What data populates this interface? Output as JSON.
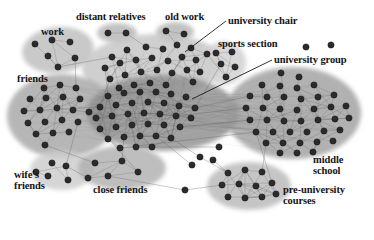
{
  "figure": {
    "background": "#ffffff",
    "width": 374,
    "height": 225
  },
  "style": {
    "node_fill": "#2b2b2b",
    "node_stroke": "#151515",
    "edge_color": "#5a5a5a",
    "label_color": "#141414",
    "leader_color": "#1b1b1b",
    "cluster_light": "#d2d2d2",
    "cluster_mid": "#b9b9b9",
    "cluster_dark": "#9a9a9a",
    "cluster_darkest": "#8a8a8a"
  },
  "labels": [
    {
      "id": "work",
      "text": "work",
      "x": 41,
      "y": 27,
      "size": 10.5
    },
    {
      "id": "distant-relatives",
      "text": "distant relatives",
      "x": 76,
      "y": 12,
      "size": 10.5
    },
    {
      "id": "old-work",
      "text": "old work",
      "x": 165,
      "y": 12,
      "size": 10.5
    },
    {
      "id": "university-chair",
      "text": "university chair",
      "x": 228,
      "y": 16,
      "size": 10.5
    },
    {
      "id": "sports-section",
      "text": "sports section",
      "x": 218,
      "y": 39,
      "size": 10.5
    },
    {
      "id": "university-group",
      "text": "university group",
      "x": 274,
      "y": 55,
      "size": 10.5
    },
    {
      "id": "friends",
      "text": "friends",
      "x": 17,
      "y": 74,
      "size": 10.5
    },
    {
      "id": "middle-school",
      "text": "middle\nschool",
      "x": 313,
      "y": 155,
      "size": 10.5
    },
    {
      "id": "wifes-friends",
      "text": "wife's\nfriends",
      "x": 14,
      "y": 170,
      "size": 10.5
    },
    {
      "id": "close-friends",
      "text": "close friends",
      "x": 93,
      "y": 185,
      "size": 10.5
    },
    {
      "id": "pre-university-courses",
      "text": "pre-university\ncourses",
      "x": 283,
      "y": 185,
      "size": 10.5
    }
  ],
  "leader_lines": [
    {
      "id": "leader-university-chair",
      "x1": 226,
      "y1": 21,
      "x2": 185,
      "y2": 52
    },
    {
      "id": "leader-university-group",
      "x1": 272,
      "y1": 60,
      "x2": 192,
      "y2": 99
    }
  ],
  "clusters": [
    {
      "id": "work",
      "label": "work",
      "cx": 58,
      "cy": 50,
      "rx": 36,
      "ry": 23,
      "rot": -6,
      "shade": "#bdbdbd",
      "nodes": 6
    },
    {
      "id": "distant-relatives",
      "label": "distant relatives",
      "cx": 117,
      "cy": 33,
      "rx": 20,
      "ry": 10,
      "rot": 0,
      "shade": "#b4b4b4",
      "nodes": 2
    },
    {
      "id": "old-work",
      "label": "old work",
      "cx": 175,
      "cy": 32,
      "rx": 19,
      "ry": 10,
      "rot": 0,
      "shade": "#b4b4b4",
      "nodes": 2
    },
    {
      "id": "university-chair",
      "label": "university chair",
      "cx": 152,
      "cy": 66,
      "rx": 70,
      "ry": 32,
      "rot": -3,
      "shade": "#c4c4c4",
      "nodes": 24
    },
    {
      "id": "sports-section",
      "label": "sports section",
      "cx": 224,
      "cy": 63,
      "rx": 22,
      "ry": 22,
      "rot": 0,
      "shade": "#cfcfcf",
      "nodes": 5
    },
    {
      "id": "friends",
      "label": "friends",
      "cx": 62,
      "cy": 116,
      "rx": 55,
      "ry": 42,
      "rot": 0,
      "shade": "#a6a6a6",
      "nodes": 20
    },
    {
      "id": "university-group",
      "label": "university group",
      "cx": 163,
      "cy": 113,
      "rx": 76,
      "ry": 38,
      "rot": 0,
      "shade": "#909090",
      "nodes": 42
    },
    {
      "id": "middle-school",
      "label": "middle school",
      "cx": 293,
      "cy": 113,
      "rx": 68,
      "ry": 46,
      "rot": 0,
      "shade": "#a0a0a0",
      "nodes": 40
    },
    {
      "id": "wifes-friends",
      "label": "wife's friends",
      "cx": 62,
      "cy": 170,
      "rx": 32,
      "ry": 20,
      "rot": 0,
      "shade": "#cccccc",
      "nodes": 5
    },
    {
      "id": "close-friends",
      "label": "close friends",
      "cx": 122,
      "cy": 168,
      "rx": 44,
      "ry": 22,
      "rot": 0,
      "shade": "#b0b0b0",
      "nodes": 5
    },
    {
      "id": "pre-university-courses",
      "label": "pre-university courses",
      "cx": 249,
      "cy": 186,
      "rx": 42,
      "ry": 24,
      "rot": 0,
      "shade": "#b8b8b8",
      "nodes": 11
    }
  ],
  "chart_data": {
    "type": "scatter",
    "xlabel": "",
    "ylabel": "",
    "legend_position": "none",
    "grid": false,
    "cluster_names": [
      "work",
      "distant relatives",
      "old work",
      "university chair",
      "sports section",
      "friends",
      "university group",
      "middle school",
      "wife's friends",
      "close friends",
      "pre-university courses",
      "isolated"
    ],
    "cluster_sizes": [
      6,
      2,
      2,
      24,
      5,
      20,
      42,
      40,
      5,
      5,
      11,
      7
    ],
    "total_nodes": 169,
    "nodes": [
      {
        "g": "work",
        "x": 35,
        "y": 44
      },
      {
        "g": "work",
        "x": 52,
        "y": 40
      },
      {
        "g": "work",
        "x": 70,
        "y": 42
      },
      {
        "g": "work",
        "x": 48,
        "y": 56
      },
      {
        "g": "work",
        "x": 75,
        "y": 58
      },
      {
        "g": "work",
        "x": 58,
        "y": 67
      },
      {
        "g": "distant-relatives",
        "x": 108,
        "y": 33
      },
      {
        "g": "distant-relatives",
        "x": 126,
        "y": 33
      },
      {
        "g": "old-work",
        "x": 166,
        "y": 31
      },
      {
        "g": "old-work",
        "x": 184,
        "y": 34
      },
      {
        "g": "university-chair",
        "x": 112,
        "y": 57
      },
      {
        "g": "university-chair",
        "x": 127,
        "y": 50
      },
      {
        "g": "university-chair",
        "x": 146,
        "y": 47
      },
      {
        "g": "university-chair",
        "x": 163,
        "y": 49
      },
      {
        "g": "university-chair",
        "x": 177,
        "y": 45
      },
      {
        "g": "university-chair",
        "x": 191,
        "y": 48
      },
      {
        "g": "university-chair",
        "x": 105,
        "y": 68
      },
      {
        "g": "university-chair",
        "x": 120,
        "y": 63
      },
      {
        "g": "university-chair",
        "x": 136,
        "y": 60
      },
      {
        "g": "university-chair",
        "x": 152,
        "y": 58
      },
      {
        "g": "university-chair",
        "x": 168,
        "y": 61
      },
      {
        "g": "university-chair",
        "x": 182,
        "y": 57
      },
      {
        "g": "university-chair",
        "x": 196,
        "y": 60
      },
      {
        "g": "university-chair",
        "x": 207,
        "y": 54
      },
      {
        "g": "university-chair",
        "x": 110,
        "y": 79
      },
      {
        "g": "university-chair",
        "x": 125,
        "y": 75
      },
      {
        "g": "university-chair",
        "x": 141,
        "y": 72
      },
      {
        "g": "university-chair",
        "x": 157,
        "y": 70
      },
      {
        "g": "university-chair",
        "x": 172,
        "y": 73
      },
      {
        "g": "university-chair",
        "x": 187,
        "y": 70
      },
      {
        "g": "university-chair",
        "x": 200,
        "y": 72
      },
      {
        "g": "university-chair",
        "x": 119,
        "y": 88
      },
      {
        "g": "university-chair",
        "x": 134,
        "y": 85
      },
      {
        "g": "university-chair",
        "x": 150,
        "y": 83
      },
      {
        "g": "university-chair",
        "x": 166,
        "y": 85
      },
      {
        "g": "university-chair",
        "x": 193,
        "y": 82
      },
      {
        "g": "sports-section",
        "x": 216,
        "y": 53
      },
      {
        "g": "sports-section",
        "x": 232,
        "y": 52
      },
      {
        "g": "sports-section",
        "x": 221,
        "y": 64
      },
      {
        "g": "sports-section",
        "x": 235,
        "y": 67
      },
      {
        "g": "sports-section",
        "x": 226,
        "y": 77
      },
      {
        "g": "friends",
        "x": 44,
        "y": 88
      },
      {
        "g": "friends",
        "x": 60,
        "y": 85
      },
      {
        "g": "friends",
        "x": 76,
        "y": 88
      },
      {
        "g": "friends",
        "x": 30,
        "y": 99
      },
      {
        "g": "friends",
        "x": 46,
        "y": 98
      },
      {
        "g": "friends",
        "x": 63,
        "y": 97
      },
      {
        "g": "friends",
        "x": 80,
        "y": 99
      },
      {
        "g": "friends",
        "x": 24,
        "y": 111
      },
      {
        "g": "friends",
        "x": 40,
        "y": 110
      },
      {
        "g": "friends",
        "x": 57,
        "y": 108
      },
      {
        "g": "friends",
        "x": 73,
        "y": 110
      },
      {
        "g": "friends",
        "x": 89,
        "y": 112
      },
      {
        "g": "friends",
        "x": 28,
        "y": 123
      },
      {
        "g": "friends",
        "x": 45,
        "y": 122
      },
      {
        "g": "friends",
        "x": 62,
        "y": 120
      },
      {
        "g": "friends",
        "x": 78,
        "y": 122
      },
      {
        "g": "friends",
        "x": 36,
        "y": 134
      },
      {
        "g": "friends",
        "x": 53,
        "y": 133
      },
      {
        "g": "friends",
        "x": 69,
        "y": 132
      },
      {
        "g": "friends",
        "x": 45,
        "y": 145
      },
      {
        "g": "university-group",
        "x": 108,
        "y": 96
      },
      {
        "g": "university-group",
        "x": 124,
        "y": 93
      },
      {
        "g": "university-group",
        "x": 140,
        "y": 92
      },
      {
        "g": "university-group",
        "x": 156,
        "y": 92
      },
      {
        "g": "university-group",
        "x": 171,
        "y": 94
      },
      {
        "g": "university-group",
        "x": 186,
        "y": 97
      },
      {
        "g": "university-group",
        "x": 100,
        "y": 107
      },
      {
        "g": "university-group",
        "x": 116,
        "y": 105
      },
      {
        "g": "university-group",
        "x": 132,
        "y": 103
      },
      {
        "g": "university-group",
        "x": 148,
        "y": 102
      },
      {
        "g": "university-group",
        "x": 164,
        "y": 103
      },
      {
        "g": "university-group",
        "x": 179,
        "y": 106
      },
      {
        "g": "university-group",
        "x": 195,
        "y": 108
      },
      {
        "g": "university-group",
        "x": 96,
        "y": 118
      },
      {
        "g": "university-group",
        "x": 112,
        "y": 116
      },
      {
        "g": "university-group",
        "x": 128,
        "y": 114
      },
      {
        "g": "university-group",
        "x": 144,
        "y": 113
      },
      {
        "g": "university-group",
        "x": 160,
        "y": 114
      },
      {
        "g": "university-group",
        "x": 176,
        "y": 116
      },
      {
        "g": "university-group",
        "x": 191,
        "y": 118
      },
      {
        "g": "university-group",
        "x": 100,
        "y": 129
      },
      {
        "g": "university-group",
        "x": 116,
        "y": 127
      },
      {
        "g": "university-group",
        "x": 132,
        "y": 125
      },
      {
        "g": "university-group",
        "x": 148,
        "y": 124
      },
      {
        "g": "university-group",
        "x": 164,
        "y": 125
      },
      {
        "g": "university-group",
        "x": 180,
        "y": 127
      },
      {
        "g": "university-group",
        "x": 108,
        "y": 139
      },
      {
        "g": "university-group",
        "x": 124,
        "y": 137
      },
      {
        "g": "university-group",
        "x": 140,
        "y": 136
      },
      {
        "g": "university-group",
        "x": 156,
        "y": 136
      },
      {
        "g": "university-group",
        "x": 171,
        "y": 138
      },
      {
        "g": "university-group",
        "x": 120,
        "y": 148
      },
      {
        "g": "university-group",
        "x": 136,
        "y": 147
      },
      {
        "g": "university-group",
        "x": 152,
        "y": 147
      },
      {
        "g": "middle-school",
        "x": 281,
        "y": 73
      },
      {
        "g": "middle-school",
        "x": 299,
        "y": 77
      },
      {
        "g": "middle-school",
        "x": 262,
        "y": 85
      },
      {
        "g": "middle-school",
        "x": 280,
        "y": 86
      },
      {
        "g": "middle-school",
        "x": 297,
        "y": 88
      },
      {
        "g": "middle-school",
        "x": 314,
        "y": 85
      },
      {
        "g": "middle-school",
        "x": 250,
        "y": 96
      },
      {
        "g": "middle-school",
        "x": 267,
        "y": 97
      },
      {
        "g": "middle-school",
        "x": 284,
        "y": 97
      },
      {
        "g": "middle-school",
        "x": 301,
        "y": 99
      },
      {
        "g": "middle-school",
        "x": 318,
        "y": 97
      },
      {
        "g": "middle-school",
        "x": 334,
        "y": 95
      },
      {
        "g": "middle-school",
        "x": 246,
        "y": 108
      },
      {
        "g": "middle-school",
        "x": 263,
        "y": 108
      },
      {
        "g": "middle-school",
        "x": 280,
        "y": 109
      },
      {
        "g": "middle-school",
        "x": 297,
        "y": 110
      },
      {
        "g": "middle-school",
        "x": 314,
        "y": 109
      },
      {
        "g": "middle-school",
        "x": 331,
        "y": 107
      },
      {
        "g": "middle-school",
        "x": 346,
        "y": 106
      },
      {
        "g": "middle-school",
        "x": 250,
        "y": 120
      },
      {
        "g": "middle-school",
        "x": 267,
        "y": 120
      },
      {
        "g": "middle-school",
        "x": 284,
        "y": 121
      },
      {
        "g": "middle-school",
        "x": 301,
        "y": 121
      },
      {
        "g": "middle-school",
        "x": 318,
        "y": 120
      },
      {
        "g": "middle-school",
        "x": 335,
        "y": 119
      },
      {
        "g": "middle-school",
        "x": 349,
        "y": 118
      },
      {
        "g": "middle-school",
        "x": 256,
        "y": 132
      },
      {
        "g": "middle-school",
        "x": 273,
        "y": 132
      },
      {
        "g": "middle-school",
        "x": 290,
        "y": 132
      },
      {
        "g": "middle-school",
        "x": 307,
        "y": 132
      },
      {
        "g": "middle-school",
        "x": 324,
        "y": 131
      },
      {
        "g": "middle-school",
        "x": 340,
        "y": 130
      },
      {
        "g": "middle-school",
        "x": 266,
        "y": 143
      },
      {
        "g": "middle-school",
        "x": 283,
        "y": 143
      },
      {
        "g": "middle-school",
        "x": 300,
        "y": 143
      },
      {
        "g": "middle-school",
        "x": 317,
        "y": 142
      },
      {
        "g": "middle-school",
        "x": 333,
        "y": 141
      },
      {
        "g": "middle-school",
        "x": 280,
        "y": 153
      },
      {
        "g": "middle-school",
        "x": 297,
        "y": 153
      },
      {
        "g": "middle-school",
        "x": 313,
        "y": 152
      },
      {
        "g": "wifes-friends",
        "x": 52,
        "y": 163
      },
      {
        "g": "wifes-friends",
        "x": 66,
        "y": 166
      },
      {
        "g": "wifes-friends",
        "x": 48,
        "y": 176
      },
      {
        "g": "wifes-friends",
        "x": 68,
        "y": 180
      },
      {
        "g": "wifes-friends",
        "x": 36,
        "y": 172
      },
      {
        "g": "close-friends",
        "x": 95,
        "y": 163
      },
      {
        "g": "close-friends",
        "x": 122,
        "y": 161
      },
      {
        "g": "close-friends",
        "x": 108,
        "y": 176
      },
      {
        "g": "close-friends",
        "x": 138,
        "y": 172
      },
      {
        "g": "close-friends",
        "x": 88,
        "y": 178
      },
      {
        "g": "pre-university-courses",
        "x": 228,
        "y": 173
      },
      {
        "g": "pre-university-courses",
        "x": 245,
        "y": 170
      },
      {
        "g": "pre-university-courses",
        "x": 262,
        "y": 172
      },
      {
        "g": "pre-university-courses",
        "x": 222,
        "y": 185
      },
      {
        "g": "pre-university-courses",
        "x": 239,
        "y": 184
      },
      {
        "g": "pre-university-courses",
        "x": 256,
        "y": 186
      },
      {
        "g": "pre-university-courses",
        "x": 272,
        "y": 183
      },
      {
        "g": "pre-university-courses",
        "x": 228,
        "y": 197
      },
      {
        "g": "pre-university-courses",
        "x": 245,
        "y": 198
      },
      {
        "g": "pre-university-courses",
        "x": 262,
        "y": 197
      },
      {
        "g": "pre-university-courses",
        "x": 276,
        "y": 194
      },
      {
        "g": "isolated",
        "x": 306,
        "y": 47
      },
      {
        "g": "isolated",
        "x": 331,
        "y": 45
      },
      {
        "g": "isolated",
        "x": 219,
        "y": 147
      },
      {
        "g": "isolated",
        "x": 200,
        "y": 157
      },
      {
        "g": "isolated",
        "x": 213,
        "y": 160
      },
      {
        "g": "isolated",
        "x": 192,
        "y": 165
      },
      {
        "g": "isolated",
        "x": 185,
        "y": 190
      }
    ]
  }
}
